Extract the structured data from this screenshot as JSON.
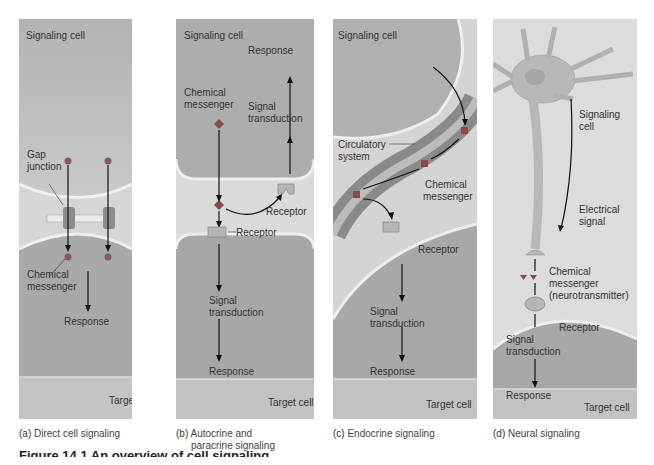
{
  "panels": [
    {
      "id": "a",
      "caption_letter": "(a)",
      "caption_text": "Direct cell signaling",
      "labels": {
        "signaling_cell": "Signaling cell",
        "gap_junction_1": "Gap",
        "gap_junction_2": "junction",
        "chemical_1": "Chemical",
        "chemical_2": "messenger",
        "response": "Response",
        "target_cell": "Target cell"
      }
    },
    {
      "id": "b",
      "caption_letter": "(b)",
      "caption_text": "Autocrine and",
      "caption_text_2": "paracrine signaling",
      "labels": {
        "signaling_cell": "Signaling cell",
        "response_top": "Response",
        "chemical_1": "Chemical",
        "chemical_2": "messenger",
        "signal_1": "Signal",
        "signal_2": "transduction",
        "receptor_right": "Receptor",
        "receptor_left": "Receptor",
        "signal_b1": "Signal",
        "signal_b2": "transduction",
        "response_bottom": "Response",
        "target_cell": "Target cell"
      }
    },
    {
      "id": "c",
      "caption_letter": "(c)",
      "caption_text": "Endocrine signaling",
      "labels": {
        "signaling_cell": "Signaling cell",
        "circulatory_1": "Circulatory",
        "circulatory_2": "system",
        "chemical_1": "Chemical",
        "chemical_2": "messenger",
        "receptor": "Receptor",
        "signal_1": "Signal",
        "signal_2": "transduction",
        "response": "Response",
        "target_cell": "Target cell"
      }
    },
    {
      "id": "d",
      "caption_letter": "(d)",
      "caption_text": "Neural signaling",
      "labels": {
        "signaling_1": "Signaling",
        "signaling_2": "cell",
        "electrical_1": "Electrical",
        "electrical_2": "signal",
        "chemical_1": "Chemical",
        "chemical_2": "messenger",
        "chemical_3": "(neurotransmitter)",
        "receptor": "Receptor",
        "signal_1": "Signal",
        "signal_2": "transduction",
        "response": "Response",
        "target_cell": "Target cell"
      }
    }
  ],
  "figure_title": "Figure 14.1  An overview of cell signaling",
  "colors": {
    "cell_fill": "#a9a9a9",
    "membrane": "#e2e2e2",
    "messenger": "#8a4a4a",
    "arrow": "#111111"
  }
}
